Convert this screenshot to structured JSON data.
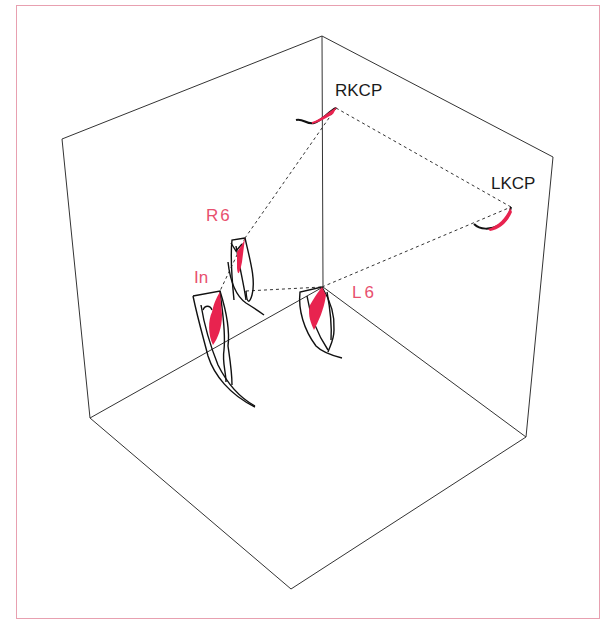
{
  "figure": {
    "colors": {
      "frame_border": "#e8a0b0",
      "box_lines": "#333333",
      "dotted_lines": "#333333",
      "tooth_outline": "#111111",
      "tooth_fill": "#e8234f",
      "label_black": "#1a1a1a",
      "label_pink": "#e8506e"
    },
    "box": {
      "top_vertex": [
        322,
        36
      ],
      "left_top": [
        62,
        139
      ],
      "right_top": [
        553,
        157
      ],
      "left_bottom": [
        90,
        418
      ],
      "right_bottom": [
        526,
        437
      ],
      "bottom_vertex": [
        291,
        589
      ],
      "inner_vertex": [
        323,
        287
      ]
    },
    "labels": [
      {
        "id": "rkcp",
        "text": "RKCP",
        "x": 335,
        "y": 82,
        "color": "black"
      },
      {
        "id": "lkcp",
        "text": "LKCP",
        "x": 491,
        "y": 175,
        "color": "black"
      },
      {
        "id": "r6",
        "text": "R6",
        "x": 206,
        "y": 207,
        "color": "pink"
      },
      {
        "id": "in",
        "text": "In",
        "x": 194,
        "y": 269,
        "color": "pink"
      },
      {
        "id": "l6",
        "text": "L6",
        "x": 352,
        "y": 284,
        "color": "pink"
      }
    ],
    "points": {
      "RKCP": [
        336,
        108
      ],
      "LKCP": [
        511,
        207
      ],
      "R6": [
        245,
        238
      ],
      "In": [
        220,
        291
      ],
      "L6": [
        322,
        287
      ]
    },
    "connections": [
      [
        "RKCP",
        "R6"
      ],
      [
        "RKCP",
        "LKCP"
      ],
      [
        "R6",
        "In"
      ],
      [
        "In",
        "L6"
      ],
      [
        "L6",
        "LKCP"
      ]
    ]
  }
}
